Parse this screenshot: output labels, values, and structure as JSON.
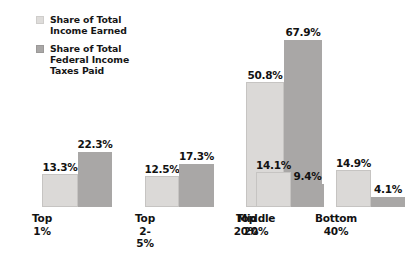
{
  "chart_data": {
    "type": "bar",
    "title": "",
    "subtitle": "",
    "xlabel": "",
    "ylabel": "",
    "grid": false,
    "legend_position": "top-left",
    "axis_visible": false,
    "ylim": [
      0,
      67.9
    ],
    "categories": [
      "Top 1%",
      "Top 2-5%",
      "Top 20%",
      "Middle\n20%",
      "Bottom\n40%"
    ],
    "series": [
      {
        "name": "Share of Total\nIncome Earned",
        "color": "#dbd9d7",
        "values": [
          13.3,
          12.5,
          50.8,
          14.1,
          14.9
        ],
        "labels": [
          "13.3%",
          "12.5%",
          "50.8%",
          "14.1%",
          "14.9%"
        ]
      },
      {
        "name": "Share of Total\nFederal Income\nTaxes Paid",
        "color": "#a9a7a6",
        "values": [
          22.3,
          17.3,
          67.9,
          9.4,
          4.1
        ],
        "labels": [
          "22.3%",
          "17.3%",
          "67.9%",
          "9.4%",
          "4.1%"
        ]
      }
    ]
  },
  "legend": {
    "entries": [
      {
        "label": "Share of Total\nIncome Earned",
        "swatch": "light"
      },
      {
        "label": "Share of Total\nFederal Income\nTaxes Paid",
        "swatch": "dark"
      }
    ]
  },
  "colors": {
    "background": "#ffffff",
    "series_light": "#dbd9d7",
    "series_dark": "#a9a7a6",
    "text": "#121212"
  }
}
